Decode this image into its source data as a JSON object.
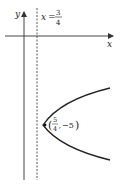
{
  "diagram": {
    "type": "parabola-graph",
    "axes": {
      "x_label": "x",
      "y_label": "y"
    },
    "directrix": {
      "label_lhs": "x",
      "label_eq": "=",
      "numerator": "3",
      "denominator": "4",
      "style": "dashed"
    },
    "focus": {
      "numerator": "5",
      "denominator": "4",
      "y_value": "−5",
      "open_paren": "(",
      "close_paren": ")",
      "comma": ","
    },
    "colors": {
      "axis": "#333333",
      "curve": "#222222",
      "directrix": "#555555"
    }
  }
}
